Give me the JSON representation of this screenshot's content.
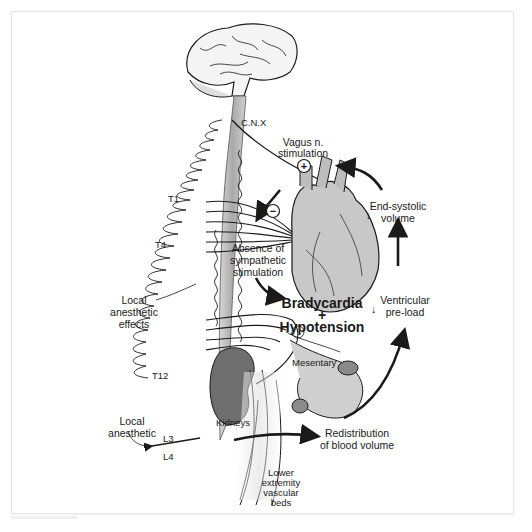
{
  "figure": {
    "labels": {
      "cnx": "C.N.X",
      "vagus_line1": "Vagus n.",
      "vagus_line2": "stimulation",
      "plus": "+",
      "minus": "−",
      "t1": "T1",
      "t4": "T4",
      "t12": "T12",
      "l3": "L3",
      "l4": "L4",
      "absence_line1": "Absence of",
      "absence_line2": "sympathetic",
      "absence_line3": "stimulation",
      "end_systolic_line1": "End-systolic",
      "end_systolic_line2": "volume",
      "brady": "Bradycardia",
      "brady_plus": "+",
      "hypo": "Hypotension",
      "ventricular_line1": "Ventricular",
      "ventricular_line2": "pre-load",
      "local_effects_line1": "Local",
      "local_effects_line2": "anesthetic",
      "local_effects_line3": "effects",
      "mesentary": "Mesentary",
      "kidneys": "Kidneys",
      "local_anesthetic_line1": "Local",
      "local_anesthetic_line2": "anesthetic",
      "redistribution_line1": "Redistribution",
      "redistribution_line2": "of blood volume",
      "lower_line1": "Lower",
      "lower_line2": "extremity",
      "lower_line3": "vascular",
      "lower_line4": "beds",
      "down_arrow": "↓"
    },
    "colors": {
      "ink": "#1a1a1a",
      "organ_fill": "#c8c8c8",
      "kidney_fill": "#6e6e6e",
      "cord_fill": "#b8b8b8",
      "brain_fill": "#f4f4f4"
    }
  }
}
